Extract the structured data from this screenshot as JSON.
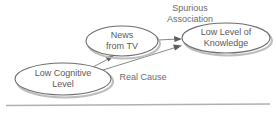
{
  "diagram": {
    "nodes": [
      {
        "id": "low-cognitive-level",
        "line1": "Low Cognitive",
        "line2": "Level",
        "cx": 63,
        "cy": 79,
        "rx": 48,
        "ry": 16
      },
      {
        "id": "news-from-tv",
        "line1": "News",
        "line2": "from TV",
        "cx": 122,
        "cy": 41,
        "rx": 36,
        "ry": 15
      },
      {
        "id": "low-level-of-knowledge",
        "line1": "Low Level of",
        "line2": "Knowledge",
        "cx": 226,
        "cy": 38,
        "rx": 44,
        "ry": 15
      }
    ],
    "edge_labels": [
      {
        "id": "spurious-association",
        "line1": "Spurious",
        "line2": "Association",
        "x": 190,
        "y1": 9,
        "y2": 20
      },
      {
        "id": "real-cause",
        "line1": "Real Cause",
        "x": 143,
        "y1": 78
      }
    ],
    "edges": [
      {
        "id": "news-to-knowledge",
        "from": "news-from-tv",
        "to": "low-level-of-knowledge",
        "relation": "Spurious Association"
      },
      {
        "id": "cognitive-to-news",
        "from": "low-cognitive-level",
        "to": "news-from-tv",
        "relation": "Real Cause"
      },
      {
        "id": "cognitive-to-knowledge",
        "from": "low-cognitive-level",
        "to": "low-level-of-knowledge",
        "relation": "Real Cause"
      }
    ],
    "colors": {
      "node_stroke": "#6d6d6d",
      "node_fill": "#ffffff",
      "text": "#5a5a5a",
      "edge": "#7a7a7a",
      "rule": "#b0b0b0",
      "background": "#ffffff"
    }
  }
}
